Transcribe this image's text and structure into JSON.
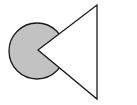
{
  "diagram": {
    "background": "#ffffff",
    "stroke": "#1a1a1a",
    "circle": {
      "cx": 37,
      "cy": 51,
      "r": 28,
      "fill": "#c2c2c2"
    },
    "triangle": {
      "points": "38,50 97,5 97,99",
      "fill": "#ffffff"
    }
  }
}
